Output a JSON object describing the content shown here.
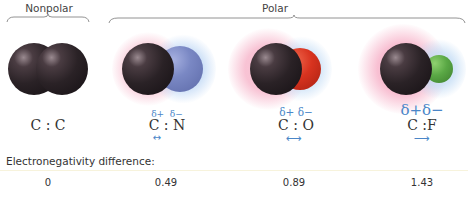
{
  "groups": {
    "nonpolar": "Nonpolar",
    "polar": "Polar"
  },
  "molecules": [
    {
      "formula": "C : C",
      "delta_plus": "",
      "delta_minus": "",
      "arrow": "",
      "en_diff": "0",
      "atom2_color": "#2a2226"
    },
    {
      "formula": "C : N",
      "delta_plus": "δ+",
      "delta_minus": "δ−",
      "arrow": "↔",
      "en_diff": "0.49",
      "atom2_color": "#7a88c4"
    },
    {
      "formula": "C : O",
      "delta_plus": "δ+",
      "delta_minus": "δ−",
      "arrow": "⟷",
      "en_diff": "0.89",
      "atom2_color": "#d8331f"
    },
    {
      "formula": "C :F",
      "delta_plus": "δ+",
      "delta_minus": "δ−",
      "arrow": "⟶",
      "en_diff": "1.43",
      "atom2_color": "#5aa845"
    }
  ],
  "en_label": "Electronegativity difference:",
  "colors": {
    "carbon": "#2a2226",
    "delta_blue": "#4a86c8",
    "halo_pink": "#f6c6d3",
    "halo_blue": "#cfe3f6"
  }
}
